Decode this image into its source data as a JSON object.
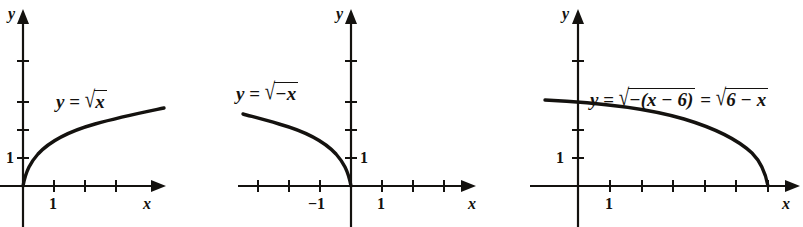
{
  "figure": {
    "background_color": "#ffffff",
    "ink_color": "#14120f",
    "panels": [
      {
        "id": "panel-sqrt-x",
        "equation_text": "y = √x",
        "equation_parts": {
          "lhs": "y",
          "equals": "=",
          "radical": "√",
          "radicand": "x"
        },
        "x_axis_label": "x",
        "y_axis_label": "y",
        "x_tick_labels": [
          "1"
        ],
        "y_tick_labels": [
          "1"
        ],
        "x_tick_count": 3,
        "y_tick_count": 4,
        "curve_description": "increasing square root curve from origin rising to the right"
      },
      {
        "id": "panel-sqrt-neg-x",
        "equation_text": "y = √−x",
        "equation_parts": {
          "lhs": "y",
          "equals": "=",
          "radical": "√",
          "radicand": "−x"
        },
        "x_axis_label": "x",
        "y_axis_label": "y",
        "x_tick_labels": [
          "−1",
          "1"
        ],
        "y_tick_labels": [
          "1"
        ],
        "x_tick_count": 7,
        "y_tick_count": 4,
        "curve_description": "square root of negative x, decreasing from upper left down to the origin"
      },
      {
        "id": "panel-sqrt-6-minus-x",
        "equation_text": "y = √−(x − 6) = √6 − x",
        "equation_parts": {
          "lhs": "y",
          "equals_first": "=",
          "radical_first": "√",
          "radicand_first": "−(x − 6)",
          "equals_second": "=",
          "radical_second": "√",
          "radicand_second": "6 − x"
        },
        "x_axis_label": "x",
        "y_axis_label": "y",
        "x_tick_labels": [
          "1"
        ],
        "y_tick_labels": [
          "1"
        ],
        "x_tick_count": 6,
        "y_tick_count": 4,
        "curve_description": "square root of 6 minus x, decreasing from upper left and meeting the x-axis at x = 6"
      }
    ]
  }
}
